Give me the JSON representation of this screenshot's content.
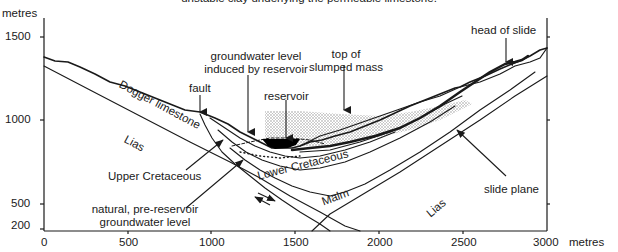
{
  "caption": "unstable clay underlying the permeable limestone.",
  "axes": {
    "y_unit": "metres",
    "x_unit": "metres",
    "y_ticks": [
      "1500",
      "1000",
      "500",
      "200"
    ],
    "x_ticks": [
      "0",
      "500",
      "1000",
      "1500",
      "2000",
      "2500",
      "3000"
    ]
  },
  "labels": {
    "head_of_slide": "head of slide",
    "groundwater_induced_1": "groundwater level",
    "groundwater_induced_2": "induced by reservoir",
    "top_slumped_1": "top of",
    "top_slumped_2": "slumped mass",
    "fault": "fault",
    "reservoir": "reservoir",
    "upper_cretaceous": "Upper Cretaceous",
    "natural_gw_1": "natural, pre-reservoir",
    "natural_gw_2": "groundwater level",
    "slide_plane": "slide plane"
  },
  "strata": {
    "dogger": "Dogger limestone",
    "lias_left": "Lias",
    "lower_cretaceous": "Lower Cretaceous",
    "malm": "Malm",
    "lias_right": "Lias"
  },
  "colors": {
    "line": "#1a1a1a",
    "stipple": "#bdbdbd",
    "reservoir": "#000000"
  }
}
